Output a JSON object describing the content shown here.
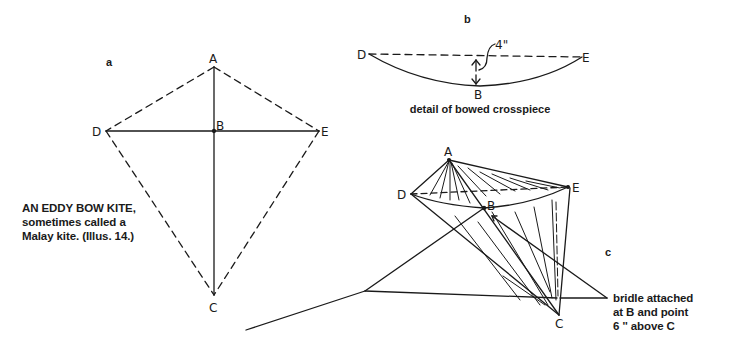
{
  "figure": {
    "title_caption": {
      "lines": [
        "AN EDDY BOW KITE,",
        "sometimes called a",
        "Malay kite. (Illus. 14.)"
      ]
    },
    "panel_a": {
      "label": "a",
      "points": {
        "A": "A",
        "B": "B",
        "C": "C",
        "D": "D",
        "E": "E"
      }
    },
    "panel_b": {
      "label": "b",
      "points": {
        "D": "D",
        "E": "E",
        "B": "B"
      },
      "measurement": "4\"",
      "caption": "detail of bowed crosspiece"
    },
    "panel_c": {
      "label": "c",
      "points": {
        "A": "A",
        "B": "B",
        "C": "C",
        "D": "D",
        "E": "E"
      },
      "caption_lines": [
        "bridle attached",
        "at B and point",
        "6 '' above C"
      ]
    }
  },
  "colors": {
    "ink": "#1a1a1a",
    "background": "#ffffff"
  }
}
